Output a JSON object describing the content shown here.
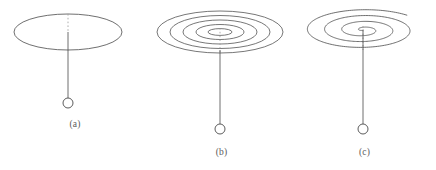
{
  "figure": {
    "title": "",
    "background_color": "#ffffff",
    "stroke_color": "#4a4a4a",
    "dashed_stroke_color": "#9a9a9a",
    "width": 436,
    "height": 170
  },
  "panels": [
    {
      "id": "a",
      "caption": "(a)",
      "description": "conical pendulum with circular orbit shown as a single ellipse in perspective",
      "orbit": {
        "type": "ellipse",
        "turns": 1,
        "center_x": 68,
        "center_y": 32,
        "radius_x": 54,
        "radius_y": 18
      },
      "rod": {
        "top_y": 32,
        "bottom_y": 98,
        "x": 68,
        "dashed_top_y": 14
      },
      "bob": {
        "cx": 68,
        "cy": 103,
        "r": 5
      }
    },
    {
      "id": "b",
      "caption": "(b)",
      "description": "pendulum whose bob traces concentric closed ellipses, inward-winding spiral",
      "orbit": {
        "type": "concentric-ellipses",
        "turns": 5,
        "center_x": 70,
        "center_y": 32,
        "radius_x": 63,
        "radius_y": 21,
        "ring_count": 5
      },
      "rod": {
        "top_y": 32,
        "bottom_y": 124,
        "x": 70,
        "dashed_top_y": 28
      },
      "bob": {
        "cx": 70,
        "cy": 129,
        "r": 5
      }
    },
    {
      "id": "c",
      "caption": "(c)",
      "description": "pendulum whose bob traces an open Archimedean spiral with a trailing outer arm",
      "orbit": {
        "type": "open-spiral",
        "turns": 3.6,
        "center_x": 70,
        "center_y": 30,
        "radius_x": 62,
        "radius_y": 21
      },
      "rod": {
        "top_y": 30,
        "bottom_y": 124,
        "x": 70,
        "dashed_top_y": 28
      },
      "bob": {
        "cx": 70,
        "cy": 129,
        "r": 5
      }
    }
  ]
}
